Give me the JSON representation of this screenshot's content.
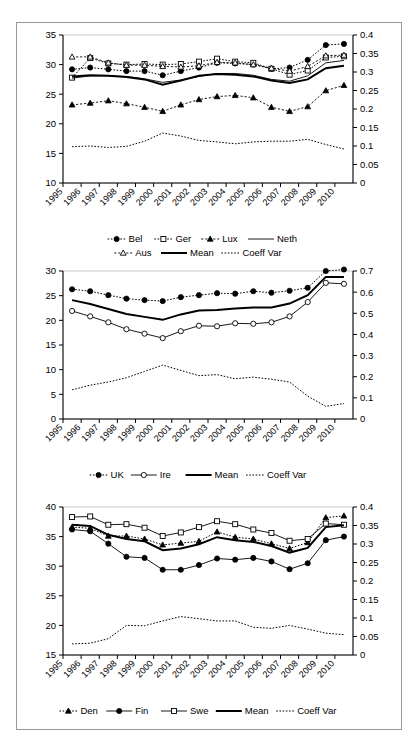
{
  "figure": {
    "panel_count": 3,
    "x_categories": [
      "1995",
      "1996",
      "1997",
      "1998",
      "1999",
      "2000",
      "2001",
      "2002",
      "2003",
      "2004",
      "2005",
      "2006",
      "2007",
      "2008",
      "2009",
      "2010"
    ]
  },
  "chart_data": [
    {
      "id": "panel-continental",
      "type": "line",
      "title": "",
      "xlabel": "",
      "ylabel": "",
      "x": [
        "1995",
        "1996",
        "1997",
        "1998",
        "1999",
        "2000",
        "2001",
        "2002",
        "2003",
        "2004",
        "2005",
        "2006",
        "2007",
        "2008",
        "2009",
        "2010"
      ],
      "ylim": [
        10,
        35
      ],
      "yticks": [
        "10",
        "15",
        "20",
        "25",
        "30",
        "35"
      ],
      "y2lim": [
        0,
        0.4
      ],
      "y2ticks": [
        "0",
        "0.05",
        "0.1",
        "0.15",
        "0.2",
        "0.25",
        "0.3",
        "0.35",
        "0.4"
      ],
      "grid": false,
      "legend_position": "bottom",
      "series": [
        {
          "name": "Bel",
          "axis": "left",
          "marker": "filled-circle",
          "line": "dotted",
          "values": [
            29.2,
            29.5,
            29.2,
            28.9,
            28.9,
            28.2,
            28.9,
            29.5,
            30.3,
            30.2,
            30.0,
            29.3,
            29.5,
            30.8,
            33.3,
            33.5
          ]
        },
        {
          "name": "Ger",
          "axis": "left",
          "marker": "open-square",
          "line": "dotted",
          "values": [
            27.8,
            31.1,
            30.2,
            30.0,
            30.1,
            30.0,
            30.1,
            30.5,
            31.0,
            30.5,
            30.3,
            29.3,
            28.3,
            29.0,
            31.2,
            31.4
          ]
        },
        {
          "name": "Lux",
          "axis": "left",
          "marker": "filled-triangle",
          "line": "dashdot",
          "values": [
            23.2,
            23.5,
            23.9,
            23.4,
            22.8,
            22.1,
            23.2,
            24.1,
            24.6,
            24.8,
            24.4,
            22.8,
            22.1,
            22.9,
            25.6,
            26.5
          ]
        },
        {
          "name": "Neth",
          "axis": "left",
          "marker": "none",
          "line": "thin",
          "values": [
            27.7,
            28.1,
            28.1,
            28.0,
            27.6,
            27.0,
            27.4,
            28.0,
            28.5,
            28.5,
            28.2,
            27.5,
            27.2,
            28.1,
            30.3,
            30.7
          ]
        },
        {
          "name": "Aus",
          "axis": "left",
          "marker": "open-triangle",
          "line": "dashdot",
          "values": [
            31.3,
            31.3,
            30.3,
            29.9,
            29.9,
            29.7,
            29.6,
            29.8,
            30.4,
            30.3,
            30.0,
            29.4,
            28.9,
            29.7,
            31.5,
            31.6
          ]
        },
        {
          "name": "Mean",
          "axis": "left",
          "marker": "none",
          "line": "thick",
          "values": [
            28.0,
            28.2,
            28.1,
            27.9,
            27.5,
            26.6,
            27.3,
            28.1,
            28.4,
            28.3,
            28.0,
            27.3,
            26.9,
            27.5,
            29.4,
            29.8
          ]
        },
        {
          "name": "Coeff Var",
          "axis": "right",
          "marker": "none",
          "line": "coeffvar",
          "values": [
            0.098,
            0.1,
            0.096,
            0.099,
            0.113,
            0.135,
            0.127,
            0.115,
            0.111,
            0.106,
            0.111,
            0.113,
            0.113,
            0.118,
            0.104,
            0.092
          ]
        }
      ],
      "legend": [
        {
          "label": "Bel",
          "marker": "filled-circle",
          "line": "dotted"
        },
        {
          "label": "Ger",
          "marker": "open-square",
          "line": "dotted"
        },
        {
          "label": "Lux",
          "marker": "filled-triangle",
          "line": "dashdot"
        },
        {
          "label": "Neth",
          "marker": "none",
          "line": "thin"
        },
        {
          "label": "Aus",
          "marker": "open-triangle",
          "line": "dashdot"
        },
        {
          "label": "Mean",
          "marker": "none",
          "line": "thick"
        },
        {
          "label": "Coeff Var",
          "marker": "none",
          "line": "coeffvar"
        }
      ]
    },
    {
      "id": "panel-anglo",
      "type": "line",
      "title": "",
      "xlabel": "",
      "ylabel": "",
      "x": [
        "1995",
        "1996",
        "1997",
        "1998",
        "1999",
        "2000",
        "2001",
        "2002",
        "2003",
        "2004",
        "2005",
        "2006",
        "2007",
        "2008",
        "2009",
        "2010"
      ],
      "ylim": [
        0,
        30
      ],
      "yticks": [
        "0",
        "5",
        "10",
        "15",
        "20",
        "25",
        "30"
      ],
      "y2lim": [
        0,
        0.7
      ],
      "y2ticks": [
        "0",
        "0.1",
        "0.2",
        "0.3",
        "0.4",
        "0.5",
        "0.6",
        "0.7"
      ],
      "grid": false,
      "legend_position": "bottom",
      "series": [
        {
          "name": "UK",
          "axis": "left",
          "marker": "filled-circle",
          "line": "dotted",
          "values": [
            26.3,
            25.9,
            25.1,
            24.4,
            24.1,
            23.9,
            24.7,
            25.1,
            25.5,
            25.4,
            25.9,
            25.6,
            26.0,
            26.6,
            30.0,
            30.3
          ]
        },
        {
          "name": "Ire",
          "axis": "left",
          "marker": "open-circle",
          "line": "thin",
          "values": [
            21.9,
            20.8,
            19.6,
            18.2,
            17.3,
            16.4,
            17.8,
            18.9,
            18.8,
            19.4,
            19.3,
            19.6,
            20.8,
            23.7,
            27.6,
            27.4
          ]
        },
        {
          "name": "Mean",
          "axis": "left",
          "marker": "none",
          "line": "thick",
          "values": [
            24.1,
            23.3,
            22.3,
            21.3,
            20.7,
            20.1,
            21.2,
            22.0,
            22.1,
            22.4,
            22.6,
            22.6,
            23.4,
            25.1,
            28.8,
            28.8
          ]
        },
        {
          "name": "Coeff Var",
          "axis": "right",
          "marker": "none",
          "line": "coeffvar",
          "values": [
            0.138,
            0.16,
            0.175,
            0.195,
            0.225,
            0.255,
            0.23,
            0.205,
            0.21,
            0.19,
            0.198,
            0.188,
            0.175,
            0.108,
            0.06,
            0.073
          ]
        }
      ],
      "legend": [
        {
          "label": "UK",
          "marker": "filled-circle",
          "line": "dotted"
        },
        {
          "label": "Ire",
          "marker": "open-circle",
          "line": "thin"
        },
        {
          "label": "Mean",
          "marker": "none",
          "line": "thick"
        },
        {
          "label": "Coeff Var",
          "marker": "none",
          "line": "coeffvar"
        }
      ]
    },
    {
      "id": "panel-nordic",
      "type": "line",
      "title": "",
      "xlabel": "",
      "ylabel": "",
      "x": [
        "1995",
        "1996",
        "1997",
        "1998",
        "1999",
        "2000",
        "2001",
        "2002",
        "2003",
        "2004",
        "2005",
        "2006",
        "2007",
        "2008",
        "2009",
        "2010"
      ],
      "ylim": [
        15,
        40
      ],
      "yticks": [
        "15",
        "20",
        "25",
        "30",
        "35",
        "40"
      ],
      "y2lim": [
        0,
        0.4
      ],
      "y2ticks": [
        "0",
        "0.05",
        "0.1",
        "0.15",
        "0.2",
        "0.25",
        "0.3",
        "0.35",
        "0.4"
      ],
      "grid": false,
      "legend_position": "bottom",
      "series": [
        {
          "name": "Den",
          "axis": "left",
          "marker": "filled-triangle",
          "line": "dotted",
          "values": [
            36.6,
            36.4,
            35.1,
            35.1,
            34.6,
            33.6,
            33.9,
            34.2,
            35.8,
            34.9,
            34.6,
            33.8,
            33.0,
            34.0,
            38.2,
            38.5
          ]
        },
        {
          "name": "Fin",
          "axis": "left",
          "marker": "filled-circle",
          "line": "thin",
          "values": [
            36.2,
            35.9,
            33.8,
            31.6,
            31.4,
            29.4,
            29.4,
            30.2,
            31.3,
            31.1,
            31.4,
            30.8,
            29.5,
            30.5,
            34.4,
            35.0
          ]
        },
        {
          "name": "Swe",
          "axis": "left",
          "marker": "open-square",
          "line": "thin",
          "values": [
            38.3,
            38.4,
            37.0,
            37.1,
            36.5,
            35.1,
            35.7,
            36.6,
            37.6,
            37.1,
            36.2,
            35.6,
            34.3,
            34.6,
            37.2,
            37.0
          ]
        },
        {
          "name": "Mean",
          "axis": "left",
          "marker": "none",
          "line": "thick",
          "values": [
            37.0,
            36.8,
            35.3,
            34.6,
            34.2,
            32.7,
            33.0,
            33.7,
            34.9,
            34.4,
            34.1,
            33.4,
            32.3,
            33.1,
            36.6,
            36.9
          ]
        },
        {
          "name": "Coeff Var",
          "axis": "right",
          "marker": "none",
          "line": "coeffvar",
          "values": [
            0.03,
            0.032,
            0.044,
            0.08,
            0.079,
            0.092,
            0.104,
            0.098,
            0.092,
            0.092,
            0.075,
            0.072,
            0.08,
            0.07,
            0.059,
            0.055
          ]
        }
      ],
      "legend": [
        {
          "label": "Den",
          "marker": "filled-triangle",
          "line": "dotted"
        },
        {
          "label": "Fin",
          "marker": "filled-circle",
          "line": "thin"
        },
        {
          "label": "Swe",
          "marker": "open-square",
          "line": "thin"
        },
        {
          "label": "Mean",
          "marker": "none",
          "line": "thick"
        },
        {
          "label": "Coeff Var",
          "marker": "none",
          "line": "coeffvar"
        }
      ]
    }
  ]
}
